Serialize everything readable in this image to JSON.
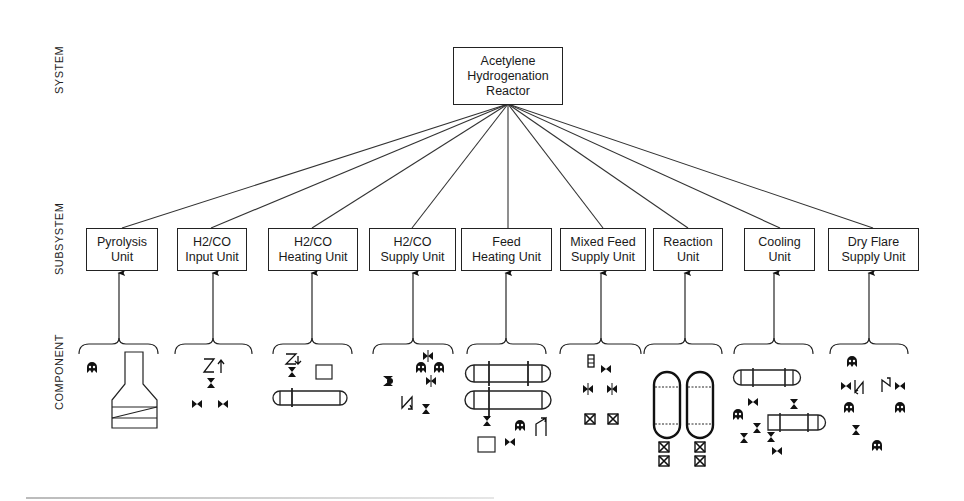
{
  "levels": {
    "system": "SYSTEM",
    "subsystem": "SUBSYSTEM",
    "component": "COMPONENT"
  },
  "system_box": {
    "line1": "Acetylene",
    "line2": "Hydrogenation",
    "line3": "Reactor"
  },
  "subsystems": [
    {
      "line1": "Pyrolysis",
      "line2": "Unit"
    },
    {
      "line1": "H2/CO",
      "line2": "Input Unit"
    },
    {
      "line1": "H2/CO",
      "line2": "Heating Unit"
    },
    {
      "line1": "H2/CO",
      "line2": "Supply Unit"
    },
    {
      "line1": "Feed",
      "line2": "Heating Unit"
    },
    {
      "line1": "Mixed Feed",
      "line2": "Supply Unit"
    },
    {
      "line1": "Reaction",
      "line2": "Unit"
    },
    {
      "line1": "Cooling",
      "line2": "Unit"
    },
    {
      "line1": "Dry Flare",
      "line2": "Supply Unit"
    }
  ],
  "component_icons": [
    [
      "pump-icon",
      "furnace-icon"
    ],
    [
      "check-valve-icon",
      "gate-valve-icon",
      "gate-valve-icon",
      "gate-valve-icon"
    ],
    [
      "check-valve-icon",
      "gate-valve-icon",
      "instrument-box-icon",
      "heat-exchanger-icon"
    ],
    [
      "control-valve-icon",
      "pump-icon",
      "pump-icon",
      "ball-valve-icon",
      "control-valve-icon",
      "check-valve-icon",
      "gate-valve-icon"
    ],
    [
      "heat-exchanger-icon",
      "heat-exchanger-icon",
      "gate-valve-icon",
      "pump-icon",
      "check-valve-icon",
      "instrument-box-icon",
      "gate-valve-icon"
    ],
    [
      "flow-meter-icon",
      "gate-valve-icon",
      "control-valve-icon",
      "control-valve-icon",
      "relief-valve-icon",
      "relief-valve-icon"
    ],
    [
      "reactor-vessel-icon",
      "reactor-vessel-icon",
      "relief-valve-icon",
      "relief-valve-icon",
      "relief-valve-icon",
      "relief-valve-icon"
    ],
    [
      "heat-exchanger-icon",
      "heat-exchanger-icon",
      "gate-valve-icon",
      "gate-valve-icon",
      "pump-icon",
      "gate-valve-icon",
      "gate-valve-icon",
      "gate-valve-icon",
      "gate-valve-icon"
    ],
    [
      "pump-icon",
      "gate-valve-icon",
      "check-valve-icon",
      "check-valve-icon",
      "gate-valve-icon",
      "pump-icon",
      "pump-icon",
      "gate-valve-icon",
      "pump-icon"
    ]
  ]
}
